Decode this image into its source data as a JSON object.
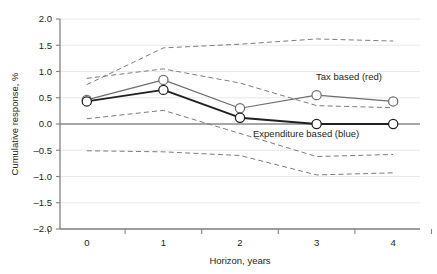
{
  "chart_data": {
    "type": "line",
    "title": "",
    "xlabel": "Horizon, years",
    "ylabel": "Cumulative response, %",
    "x": [
      0,
      1,
      2,
      3,
      4
    ],
    "xlim": [
      -0.35,
      4.35
    ],
    "ylim": [
      -2.0,
      2.0
    ],
    "yticks": [
      2.0,
      1.5,
      1.0,
      0.5,
      0.0,
      -0.5,
      -1.0,
      -1.5,
      -2.0
    ],
    "ytick_labels": [
      "2.0",
      "1.5",
      "1.0",
      "0.5",
      "0.0",
      "–0.5",
      "–1.0",
      "–1.5",
      "–2.0"
    ],
    "xticks": [
      0,
      1,
      2,
      3,
      4
    ],
    "xtick_labels": [
      "0",
      "1",
      "2",
      "3",
      "4"
    ],
    "grid": true,
    "zero_line": 0.0,
    "legend_position": "inline-annotations",
    "series": [
      {
        "name": "Tax based (red)",
        "style": "solid",
        "color": "#6d6e71",
        "marker": "open-circle",
        "values": [
          0.46,
          0.84,
          0.3,
          0.55,
          0.43
        ]
      },
      {
        "name": "Expenditure based (blue)",
        "style": "solid",
        "color": "#231f20",
        "marker": "open-circle",
        "values": [
          0.43,
          0.65,
          0.12,
          0.0,
          0.0
        ]
      },
      {
        "name": "Tax based upper band",
        "style": "dashed",
        "color": "#6d6e71",
        "marker": "none",
        "values": [
          0.87,
          1.05,
          0.78,
          0.35,
          0.31
        ]
      },
      {
        "name": "Tax based lower band",
        "style": "dashed",
        "color": "#6d6e71",
        "marker": "none",
        "values": [
          0.1,
          0.26,
          -0.18,
          -0.62,
          -0.58
        ]
      },
      {
        "name": "Expenditure based upper band",
        "style": "dashed",
        "color": "#6d6e71",
        "marker": "none",
        "values": [
          0.75,
          1.45,
          1.52,
          1.62,
          1.58
        ]
      },
      {
        "name": "Expenditure based lower band",
        "style": "dashed",
        "color": "#6d6e71",
        "marker": "none",
        "values": [
          -0.51,
          -0.53,
          -0.6,
          -0.97,
          -0.93
        ]
      }
    ],
    "annotations": [
      {
        "text": "Tax based (red)",
        "x": 3.05,
        "y": 0.8
      },
      {
        "text": "Expenditure based (blue)",
        "x": 2.55,
        "y": -0.18
      }
    ]
  }
}
